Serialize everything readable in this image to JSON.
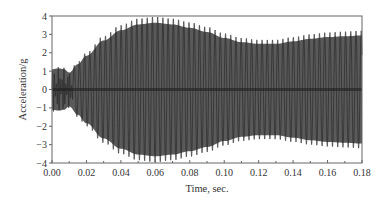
{
  "chart_data": {
    "type": "line",
    "title": "",
    "xlabel": "Time, sec.",
    "ylabel": "Acceleration/g",
    "xlim": [
      0.0,
      0.18
    ],
    "ylim": [
      -4,
      4
    ],
    "xticks": [
      "0.00",
      "0.02",
      "0.04",
      "0.06",
      "0.08",
      "0.10",
      "0.12",
      "0.14",
      "0.16",
      "0.18"
    ],
    "yticks": [
      "-4",
      "-3",
      "-2",
      "-1",
      "0",
      "1",
      "2",
      "3",
      "4"
    ],
    "grid": false,
    "legend": null,
    "series": [
      {
        "name": "Acceleration",
        "description": "Dense oscillating acceleration signal (~330 Hz); amplitude envelope values listed",
        "color": "#2a2a2a",
        "envelope_x": [
          0.0,
          0.004,
          0.007,
          0.01,
          0.015,
          0.02,
          0.03,
          0.04,
          0.05,
          0.06,
          0.07,
          0.08,
          0.09,
          0.1,
          0.11,
          0.12,
          0.13,
          0.14,
          0.15,
          0.16,
          0.17,
          0.18
        ],
        "envelope_amplitude": [
          1.2,
          1.25,
          1.2,
          1.0,
          1.5,
          2.0,
          2.9,
          3.5,
          3.85,
          3.95,
          3.85,
          3.65,
          3.4,
          3.05,
          2.8,
          2.7,
          2.7,
          2.85,
          3.0,
          3.1,
          3.15,
          3.2
        ]
      }
    ]
  }
}
